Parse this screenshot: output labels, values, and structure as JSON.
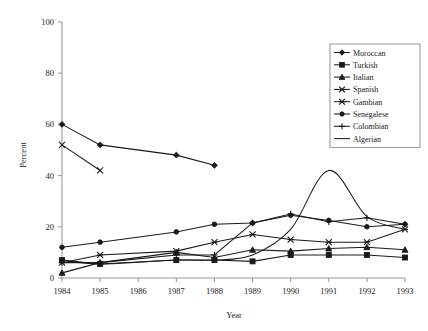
{
  "chart_data": {
    "type": "line",
    "title": "",
    "xlabel": "Year",
    "ylabel": "Percent",
    "categories": [
      1984,
      1985,
      1986,
      1987,
      1988,
      1989,
      1990,
      1991,
      1992,
      1993
    ],
    "x": [
      1984,
      1985,
      1986,
      1987,
      1988,
      1989,
      1990,
      1991,
      1992,
      1993
    ],
    "xlim": [
      1984,
      1993
    ],
    "ylim": [
      0,
      100
    ],
    "yticks": [
      0,
      20,
      40,
      60,
      80,
      100
    ],
    "xticks": [
      1984,
      1985,
      1986,
      1987,
      1988,
      1989,
      1990,
      1991,
      1992,
      1993
    ],
    "grid": false,
    "legend_position": "top-right",
    "series": [
      {
        "name": "Moroccan",
        "marker": "diamond",
        "x": [
          1984,
          1985,
          1987,
          1988
        ],
        "values": [
          60,
          52,
          48,
          44
        ]
      },
      {
        "name": "Turkish",
        "marker": "square",
        "x": [
          1984,
          1985,
          1987,
          1988,
          1989,
          1990,
          1991,
          1992,
          1993
        ],
        "values": [
          7,
          5.5,
          7,
          7,
          6.5,
          9,
          9,
          9,
          8
        ]
      },
      {
        "name": "Italian",
        "marker": "triangle",
        "x": [
          1984,
          1985,
          1987,
          1988,
          1989,
          1990,
          1991,
          1992,
          1993
        ],
        "values": [
          2,
          6,
          10,
          8,
          11,
          10.5,
          11.5,
          12,
          11
        ]
      },
      {
        "name": "Spanish",
        "marker": "cross-x",
        "x": [
          1984,
          1985
        ],
        "values": [
          52,
          42
        ]
      },
      {
        "name": "Gambian",
        "marker": "asterisk",
        "x": [
          1984,
          1985,
          1987,
          1988,
          1989,
          1990,
          1991,
          1992,
          1993
        ],
        "values": [
          6,
          9,
          10.5,
          14,
          17,
          15,
          14,
          14,
          19
        ]
      },
      {
        "name": "Senegalese",
        "marker": "circle",
        "x": [
          1984,
          1985,
          1987,
          1988,
          1989,
          1990,
          1991,
          1992,
          1993
        ],
        "values": [
          12,
          14,
          18,
          21,
          21.5,
          24.5,
          22.5,
          20,
          21
        ]
      },
      {
        "name": "Colombian",
        "marker": "plus",
        "x": [
          1984,
          1985,
          1987,
          1988,
          1989,
          1990,
          1991,
          1992,
          1993
        ],
        "values": [
          6,
          6,
          9,
          9,
          21.5,
          25,
          22,
          23.5,
          21
        ]
      },
      {
        "name": "Algerian",
        "marker": "none",
        "x": [
          1984,
          1985,
          1987,
          1988,
          1989,
          1990,
          1991,
          1992,
          1993
        ],
        "values": [
          7,
          5.5,
          7,
          7,
          9,
          19,
          42,
          24,
          19
        ]
      }
    ]
  },
  "axes": {
    "y_label": "Percent",
    "x_label": "Year",
    "y_tick_labels": [
      "0",
      "20",
      "40",
      "60",
      "80",
      "100"
    ],
    "x_tick_labels": [
      "1984",
      "1985",
      "1986",
      "1987",
      "1988",
      "1989",
      "1990",
      "1991",
      "1992",
      "1993"
    ]
  },
  "legend": {
    "entries": [
      {
        "label": "Moroccan"
      },
      {
        "label": "Turkish"
      },
      {
        "label": "Italian"
      },
      {
        "label": "Spanish"
      },
      {
        "label": "Gambian"
      },
      {
        "label": "Senegalese"
      },
      {
        "label": "Colombian"
      },
      {
        "label": "Algerian"
      }
    ]
  },
  "colors": {
    "ink": "#1a1a1a",
    "axis": "#9a9a9a",
    "background": "#ffffff"
  }
}
